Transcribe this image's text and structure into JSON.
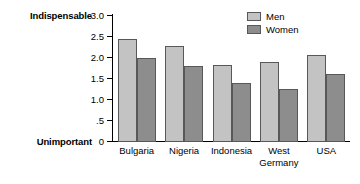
{
  "chart_data": {
    "type": "bar",
    "title": "",
    "xlabel": "",
    "ylabel": "",
    "ylim": [
      0,
      3.0
    ],
    "grid": false,
    "legend_position": "top-right",
    "categories": [
      "Bulgaria",
      "Nigeria",
      "Indonesia",
      "West\nGermany",
      "USA"
    ],
    "ytick_labels": [
      "3.0",
      "2.5",
      "2.0",
      "1.5",
      "1.0",
      ".5",
      "0"
    ],
    "ytick_values": [
      3.0,
      2.5,
      2.0,
      1.5,
      1.0,
      0.5,
      0
    ],
    "axis_anchor_high": "Indispensable",
    "axis_anchor_low": "Unimportant",
    "series": [
      {
        "name": "Men",
        "color": "#c3c3c3",
        "values": [
          2.45,
          2.28,
          1.83,
          1.89,
          2.06
        ]
      },
      {
        "name": "Women",
        "color": "#8d8d8d",
        "values": [
          2.0,
          1.8,
          1.4,
          1.26,
          1.61
        ]
      }
    ]
  },
  "legend": {
    "items": [
      {
        "label": "Men"
      },
      {
        "label": "Women"
      }
    ]
  },
  "colors": {
    "men_fill": "#c3c3c3",
    "women_fill": "#8d8d8d",
    "bar_stroke": "#58585a",
    "axis": "#000000",
    "background": "#ffffff"
  }
}
